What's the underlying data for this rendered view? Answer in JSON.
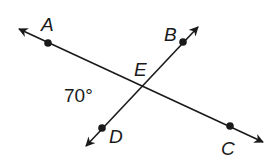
{
  "diagram": {
    "type": "intersecting-lines",
    "lines": [
      {
        "name": "line-AC",
        "through": [
          "A",
          "E",
          "C"
        ],
        "arrows": "both"
      },
      {
        "name": "line-BD",
        "through": [
          "B",
          "E",
          "D"
        ],
        "arrows": "both"
      }
    ],
    "points": {
      "A": {
        "label": "A"
      },
      "B": {
        "label": "B"
      },
      "C": {
        "label": "C"
      },
      "D": {
        "label": "D"
      },
      "E": {
        "label": "E"
      }
    },
    "angle": {
      "label": "70°",
      "between": [
        "A",
        "E",
        "D"
      ]
    },
    "colors": {
      "stroke": "#1a1a1a",
      "background": "#ffffff"
    }
  }
}
